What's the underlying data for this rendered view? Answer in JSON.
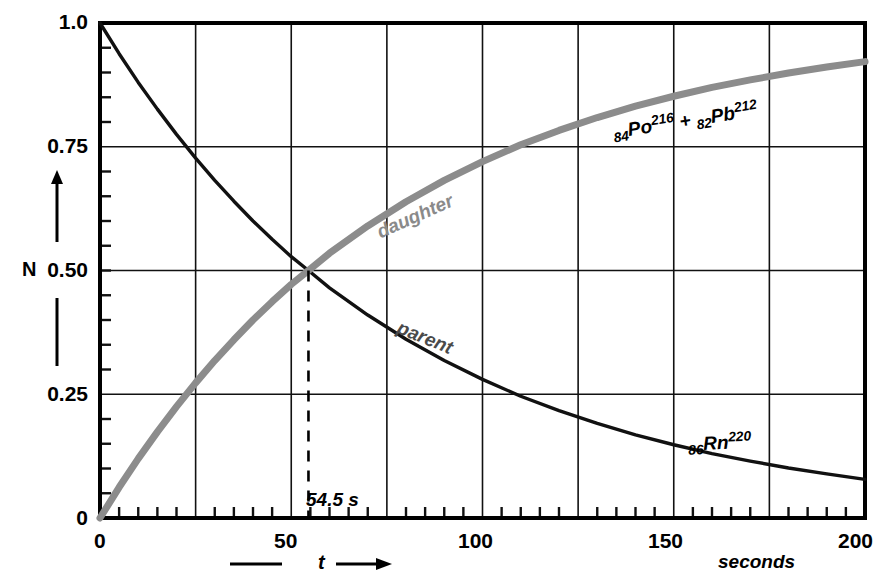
{
  "chart_data": {
    "type": "line",
    "title": "",
    "subtitle": "",
    "xlabel": "t",
    "xunit": "seconds",
    "ylabel": "N",
    "xlim": [
      0,
      200
    ],
    "ylim": [
      0,
      1.0
    ],
    "grid": true,
    "legend_position": "inline-curve-labels",
    "x_ticks": [
      0,
      50,
      100,
      150,
      200
    ],
    "x_tick_labels": [
      "0",
      "50",
      "100",
      "150",
      "200"
    ],
    "x_gridlines": [
      0,
      25,
      50,
      75,
      100,
      125,
      150,
      175,
      200
    ],
    "x_minor_tick_step": 5,
    "y_ticks": [
      0,
      0.25,
      0.5,
      0.75,
      1.0
    ],
    "y_tick_labels": [
      "0",
      "0.25",
      "0.50",
      "0.75",
      "1.0"
    ],
    "y_gridlines": [
      0,
      0.25,
      0.5,
      0.75,
      1.0
    ],
    "y_minor_tick_step": 0.05,
    "half_life_seconds": 54.5,
    "annotations": [
      {
        "text": "54.5 s",
        "x": 54.5,
        "y": 0.07,
        "kind": "half-life-marker"
      }
    ],
    "series": [
      {
        "name": "parent",
        "label": "parent",
        "formula_label": "86Rn220",
        "color": "#111111",
        "style": "solid",
        "x": [
          0,
          5,
          10,
          15,
          20,
          25,
          30,
          35,
          40,
          45,
          50,
          54.5,
          60,
          70,
          80,
          90,
          100,
          110,
          120,
          130,
          140,
          150,
          160,
          170,
          180,
          190,
          200
        ],
        "values": [
          1.0,
          0.938,
          0.88,
          0.826,
          0.775,
          0.727,
          0.682,
          0.64,
          0.6,
          0.563,
          0.528,
          0.5,
          0.465,
          0.41,
          0.361,
          0.318,
          0.28,
          0.246,
          0.217,
          0.191,
          0.168,
          0.148,
          0.13,
          0.115,
          0.101,
          0.089,
          0.078
        ]
      },
      {
        "name": "daughter",
        "label": "daughter",
        "formula_label": "84Po216 + 82Pb212",
        "color": "#8c8c8c",
        "style": "solid",
        "x": [
          0,
          5,
          10,
          15,
          20,
          25,
          30,
          35,
          40,
          45,
          50,
          54.5,
          60,
          70,
          80,
          90,
          100,
          110,
          120,
          130,
          140,
          150,
          160,
          170,
          180,
          190,
          200
        ],
        "values": [
          0.0,
          0.062,
          0.12,
          0.174,
          0.225,
          0.273,
          0.318,
          0.36,
          0.4,
          0.437,
          0.472,
          0.5,
          0.535,
          0.59,
          0.639,
          0.682,
          0.72,
          0.754,
          0.783,
          0.809,
          0.832,
          0.852,
          0.87,
          0.885,
          0.899,
          0.911,
          0.922
        ]
      }
    ]
  },
  "axes": {
    "y_axis_label": "N",
    "x_axis_label": "t",
    "x_axis_unit": "seconds"
  },
  "labels": {
    "parent_curve": "parent",
    "daughter_curve": "daughter",
    "parent_species": {
      "z": "86",
      "symbol": "Rn",
      "a": "220"
    },
    "daughter_species": {
      "z1": "84",
      "symbol1": "Po",
      "a1": "216",
      "plus": "+",
      "z2": "82",
      "symbol2": "Pb",
      "a2": "212"
    },
    "half_life": "54.5 s"
  }
}
